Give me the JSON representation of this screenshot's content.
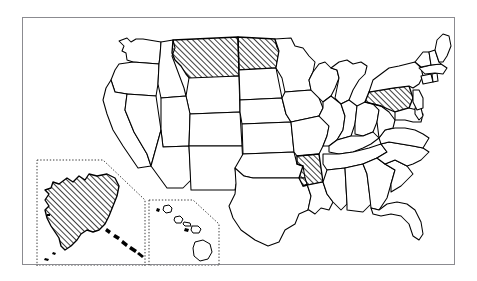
{
  "figure": {
    "frame_color": "#8b8b90",
    "background_color": "#ffffff",
    "outline_color": "#000000",
    "hatch_color": "#000000",
    "hatch_style": "diagonal lines, 45 degrees, lower-left to upper-right",
    "inset_border_style": "dotted"
  },
  "legend": {
    "hatched_meaning": "highlighted state",
    "plain_meaning": "not highlighted"
  },
  "map": {
    "projection_note": "contiguous United States with Alaska and Hawaii insets",
    "insets": [
      {
        "name": "alaska-inset",
        "label": "Alaska",
        "highlighted": true
      },
      {
        "name": "hawaii-inset",
        "label": "Hawaii",
        "highlighted": false
      }
    ],
    "highlighted_states": [
      "Montana",
      "North Dakota",
      "Pennsylvania",
      "Arkansas",
      "Alaska"
    ],
    "highlighted_count": 5,
    "states": [
      {
        "code": "WA",
        "name": "Washington",
        "highlighted": false
      },
      {
        "code": "OR",
        "name": "Oregon",
        "highlighted": false
      },
      {
        "code": "CA",
        "name": "California",
        "highlighted": false
      },
      {
        "code": "NV",
        "name": "Nevada",
        "highlighted": false
      },
      {
        "code": "ID",
        "name": "Idaho",
        "highlighted": false
      },
      {
        "code": "MT",
        "name": "Montana",
        "highlighted": true
      },
      {
        "code": "WY",
        "name": "Wyoming",
        "highlighted": false
      },
      {
        "code": "UT",
        "name": "Utah",
        "highlighted": false
      },
      {
        "code": "AZ",
        "name": "Arizona",
        "highlighted": false
      },
      {
        "code": "CO",
        "name": "Colorado",
        "highlighted": false
      },
      {
        "code": "NM",
        "name": "New Mexico",
        "highlighted": false
      },
      {
        "code": "ND",
        "name": "North Dakota",
        "highlighted": true
      },
      {
        "code": "SD",
        "name": "South Dakota",
        "highlighted": false
      },
      {
        "code": "NE",
        "name": "Nebraska",
        "highlighted": false
      },
      {
        "code": "KS",
        "name": "Kansas",
        "highlighted": false
      },
      {
        "code": "OK",
        "name": "Oklahoma",
        "highlighted": false
      },
      {
        "code": "TX",
        "name": "Texas",
        "highlighted": false
      },
      {
        "code": "MN",
        "name": "Minnesota",
        "highlighted": false
      },
      {
        "code": "IA",
        "name": "Iowa",
        "highlighted": false
      },
      {
        "code": "MO",
        "name": "Missouri",
        "highlighted": false
      },
      {
        "code": "AR",
        "name": "Arkansas",
        "highlighted": true
      },
      {
        "code": "LA",
        "name": "Louisiana",
        "highlighted": false
      },
      {
        "code": "WI",
        "name": "Wisconsin",
        "highlighted": false
      },
      {
        "code": "IL",
        "name": "Illinois",
        "highlighted": false
      },
      {
        "code": "MI",
        "name": "Michigan",
        "highlighted": false
      },
      {
        "code": "IN",
        "name": "Indiana",
        "highlighted": false
      },
      {
        "code": "OH",
        "name": "Ohio",
        "highlighted": false
      },
      {
        "code": "KY",
        "name": "Kentucky",
        "highlighted": false
      },
      {
        "code": "TN",
        "name": "Tennessee",
        "highlighted": false
      },
      {
        "code": "MS",
        "name": "Mississippi",
        "highlighted": false
      },
      {
        "code": "AL",
        "name": "Alabama",
        "highlighted": false
      },
      {
        "code": "GA",
        "name": "Georgia",
        "highlighted": false
      },
      {
        "code": "FL",
        "name": "Florida",
        "highlighted": false
      },
      {
        "code": "SC",
        "name": "South Carolina",
        "highlighted": false
      },
      {
        "code": "NC",
        "name": "North Carolina",
        "highlighted": false
      },
      {
        "code": "VA",
        "name": "Virginia",
        "highlighted": false
      },
      {
        "code": "WV",
        "name": "West Virginia",
        "highlighted": false
      },
      {
        "code": "MD",
        "name": "Maryland",
        "highlighted": false
      },
      {
        "code": "DE",
        "name": "Delaware",
        "highlighted": false
      },
      {
        "code": "PA",
        "name": "Pennsylvania",
        "highlighted": true
      },
      {
        "code": "NJ",
        "name": "New Jersey",
        "highlighted": false
      },
      {
        "code": "NY",
        "name": "New York",
        "highlighted": false
      },
      {
        "code": "CT",
        "name": "Connecticut",
        "highlighted": false
      },
      {
        "code": "RI",
        "name": "Rhode Island",
        "highlighted": false
      },
      {
        "code": "MA",
        "name": "Massachusetts",
        "highlighted": false
      },
      {
        "code": "VT",
        "name": "Vermont",
        "highlighted": false
      },
      {
        "code": "NH",
        "name": "New Hampshire",
        "highlighted": false
      },
      {
        "code": "ME",
        "name": "Maine",
        "highlighted": false
      },
      {
        "code": "AK",
        "name": "Alaska",
        "highlighted": true
      },
      {
        "code": "HI",
        "name": "Hawaii",
        "highlighted": false
      }
    ]
  }
}
